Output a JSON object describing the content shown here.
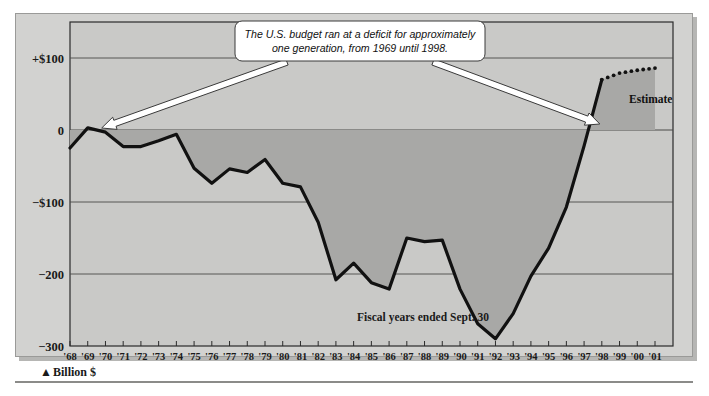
{
  "chart_data": {
    "type": "area",
    "title": "",
    "subtitle": "",
    "xlabel": "",
    "ylabel": "Billion $",
    "unit_label": "Billion $",
    "unit_marker": "▲",
    "footnote": "Fiscal years ended Sept. 30",
    "ylim": [
      -300,
      150
    ],
    "xlim": [
      1968,
      2001
    ],
    "grid": true,
    "legend": false,
    "y_ticks": [
      150,
      100,
      0,
      -100,
      -200,
      -300
    ],
    "y_tick_labels": [
      "",
      "+$100",
      "0",
      "−$100",
      "−200",
      "−300"
    ],
    "categories": [
      "'68",
      "'69",
      "'70",
      "'71",
      "'72",
      "'73",
      "'74",
      "'75",
      "'76",
      "'77",
      "'78",
      "'79",
      "'80",
      "'81",
      "'82",
      "'83",
      "'84",
      "'85",
      "'86",
      "'87",
      "'88",
      "'89",
      "'90",
      "'91",
      "'92",
      "'93",
      "'94",
      "'95",
      "'96",
      "'97",
      "'98",
      "'99",
      "'00",
      "'01"
    ],
    "x_values": [
      1968,
      1969,
      1970,
      1971,
      1972,
      1973,
      1974,
      1975,
      1976,
      1977,
      1978,
      1979,
      1980,
      1981,
      1982,
      1983,
      1984,
      1985,
      1986,
      1987,
      1988,
      1989,
      1990,
      1991,
      1992,
      1993,
      1994,
      1995,
      1996,
      1997,
      1998,
      1999,
      2000,
      2001
    ],
    "series": [
      {
        "name": "Federal budget surplus/deficit",
        "style": "solid",
        "values": [
          -25,
          3,
          -3,
          -23,
          -23,
          -15,
          -6,
          -53,
          -74,
          -54,
          -59,
          -41,
          -74,
          -79,
          -128,
          -208,
          -185,
          -212,
          -221,
          -150,
          -155,
          -153,
          -221,
          -269,
          -290,
          -255,
          -203,
          -164,
          -107,
          -22,
          70,
          null,
          null,
          null
        ]
      },
      {
        "name": "Estimate",
        "style": "dotted",
        "label": "Estimate",
        "values": [
          null,
          null,
          null,
          null,
          null,
          null,
          null,
          null,
          null,
          null,
          null,
          null,
          null,
          null,
          null,
          null,
          null,
          null,
          null,
          null,
          null,
          null,
          null,
          null,
          null,
          null,
          null,
          null,
          null,
          null,
          70,
          79,
          83,
          86
        ]
      }
    ],
    "annotations": [
      {
        "name": "callout",
        "line1": "The U.S. budget ran at a deficit for approximately",
        "line2": "one generation, from 1969 until 1998.",
        "arrow_from_year": 1969,
        "arrow_to_year": 1998
      }
    ],
    "colors": {
      "plot_background": "#c9c9c7",
      "area_fill": "#a8a8a6",
      "line": "#111111",
      "grid": "#555553",
      "callout_fill": "#ffffff",
      "panel_background": "#d2d2d0"
    }
  }
}
